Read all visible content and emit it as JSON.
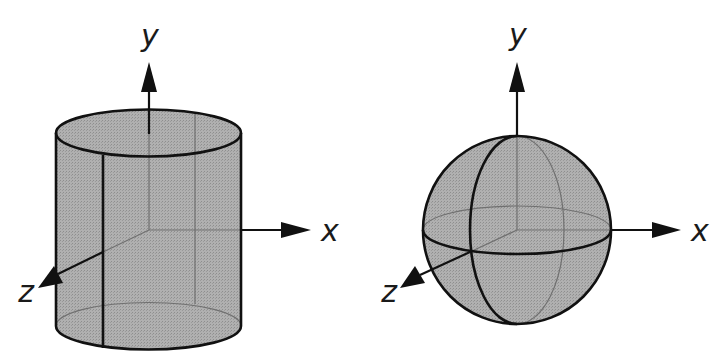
{
  "figures": [
    {
      "name": "cylinder",
      "axes": {
        "x_label": "x",
        "y_label": "y",
        "z_label": "z"
      }
    },
    {
      "name": "sphere",
      "axes": {
        "x_label": "x",
        "y_label": "y",
        "z_label": "z"
      }
    }
  ],
  "colors": {
    "fill": "#a9a9a9",
    "stroke": "#111111",
    "hidden_stroke": "#6e6e6e",
    "background": "#ffffff"
  }
}
